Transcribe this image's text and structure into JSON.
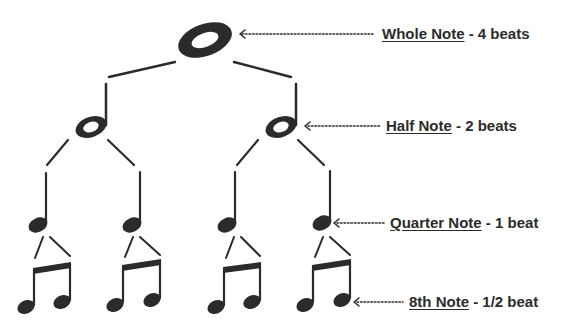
{
  "diagram": {
    "colors": {
      "ink": "#2b2b2b",
      "background": "#ffffff"
    },
    "labels": [
      {
        "name": "Whole Note",
        "sep": " - ",
        "value": "4 beats"
      },
      {
        "name": "Half Note",
        "sep": " - ",
        "value": "2 beats"
      },
      {
        "name": "Quarter Note",
        "sep": " - ",
        "value": "1 beat"
      },
      {
        "name": "8th Note",
        "sep": " - ",
        "value": "1/2 beat"
      }
    ],
    "levels": [
      {
        "note": "whole",
        "count": 1,
        "icon": "whole-note-icon"
      },
      {
        "note": "half",
        "count": 2,
        "icon": "half-note-icon"
      },
      {
        "note": "quarter",
        "count": 4,
        "icon": "quarter-note-icon"
      },
      {
        "note": "eighth-pair",
        "count": 4,
        "icon": "beamed-eighth-notes-icon"
      }
    ]
  }
}
